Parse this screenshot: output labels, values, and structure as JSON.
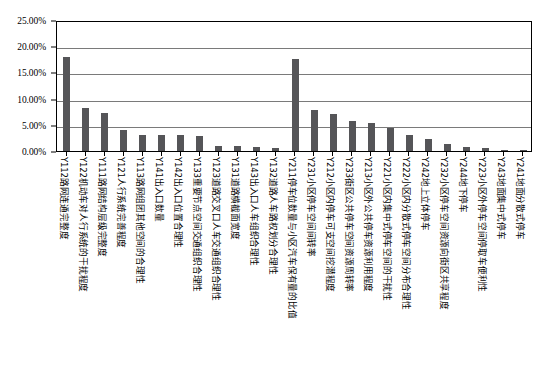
{
  "chart_data": {
    "type": "bar",
    "title": "",
    "xlabel": "",
    "ylabel": "",
    "ylim": [
      0,
      25
    ],
    "grid": true,
    "legend": false,
    "unit": "%",
    "ytick_labels": [
      "25.00%",
      "20.00%",
      "15.00%",
      "10.00%",
      "5.00%",
      "0.00%"
    ],
    "ytick_values": [
      25,
      20,
      15,
      10,
      5,
      0
    ],
    "categories": [
      "Y112路网连通完整度",
      "Y122机动车对人行系统的干扰程度",
      "Y111路网结构层级完整度",
      "Y121人行系统完善程度",
      "Y113路网组团其他空间的合理性",
      "Y141出入口数量",
      "Y142出入口位置合理性",
      "Y133重要节点空间交通组织合理性",
      "Y123道路交叉口人车交通组织合理性",
      "Y131道路横截面宽度",
      "Y143出入口人车组织合理性",
      "Y132道路人车路权划分合理性",
      "Y211停车位数量与小区汽车保有量的比值",
      "Y231小区停车空间间转率",
      "Y212小区内停车可支空间挖潜程度",
      "Y233街区公共停车空间资源周转率",
      "Y213小区外公共停车资源利用程度",
      "Y221小区内集中式停车空间的干扰性",
      "Y222小区内分散式停车空间分布合理性",
      "Y242地上立体停车",
      "Y232小区停车空间资源向街区共享程度",
      "Y244地下停车",
      "Y223小区外停车空间停取车便利性",
      "Y243地面集中式停车",
      "Y241地面分散式停车"
    ],
    "values": [
      18.0,
      8.2,
      7.3,
      4.1,
      3.0,
      3.0,
      3.1,
      2.9,
      1.0,
      0.9,
      0.8,
      0.5,
      17.5,
      7.8,
      7.0,
      5.7,
      5.3,
      4.4,
      3.1,
      2.2,
      1.3,
      0.8,
      0.6,
      0.25,
      0.1
    ]
  }
}
